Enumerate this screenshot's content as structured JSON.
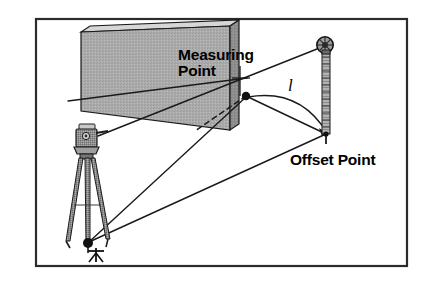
{
  "figure": {
    "frame": {
      "color": "#2b2b2b"
    },
    "labels": {
      "measuring_point": "Measuring\nPoint",
      "offset_point": "Offset Point",
      "length_symbol": "l"
    },
    "colors": {
      "line": "#1a1a1a",
      "wall_front": "#a9a9a9",
      "wall_side": "#8a8a8a",
      "wall_top": "#d9d9d9",
      "background": "#ffffff",
      "instrument": "#6f6f6f",
      "pole": "#9a9a9a"
    },
    "icons": {
      "total_station": "total-station-icon",
      "tripod": "tripod-icon",
      "prism_pole": "prism-pole-icon",
      "prism_head": "prism-reflector-icon",
      "station_marker": "survey-station-marker-icon",
      "measuring_point_dot": "measuring-point-dot-icon",
      "offset_point_tip": "offset-point-tip-icon"
    },
    "geometry": {
      "measuring_point": [
        246,
        96
      ],
      "offset_point": [
        327,
        134
      ],
      "instrument_center": [
        95,
        137
      ],
      "ground_station": [
        88,
        243
      ],
      "prism_head": [
        325,
        45
      ]
    }
  }
}
